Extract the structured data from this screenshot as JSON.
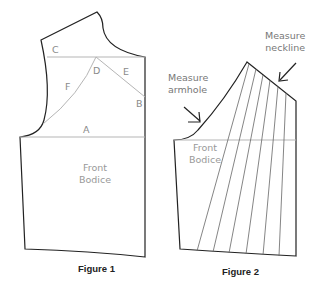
{
  "figure1": {
    "caption": "Figure 1",
    "panel_label": [
      "Front",
      "Bodice"
    ],
    "lines": {
      "A": "A",
      "B": "B",
      "C": "C",
      "D": "D",
      "E": "E",
      "F": "F"
    }
  },
  "figure2": {
    "caption": "Figure 2",
    "panel_label": [
      "Front",
      "Bodice"
    ],
    "annotations": {
      "neckline": [
        "Measure",
        "neckline"
      ],
      "armhole": [
        "Measure",
        "armhole"
      ]
    },
    "slash_lines_count": 6
  },
  "colors": {
    "outline": "#222222",
    "guide": "#b0b0b0",
    "label": "#8a8a8a"
  }
}
